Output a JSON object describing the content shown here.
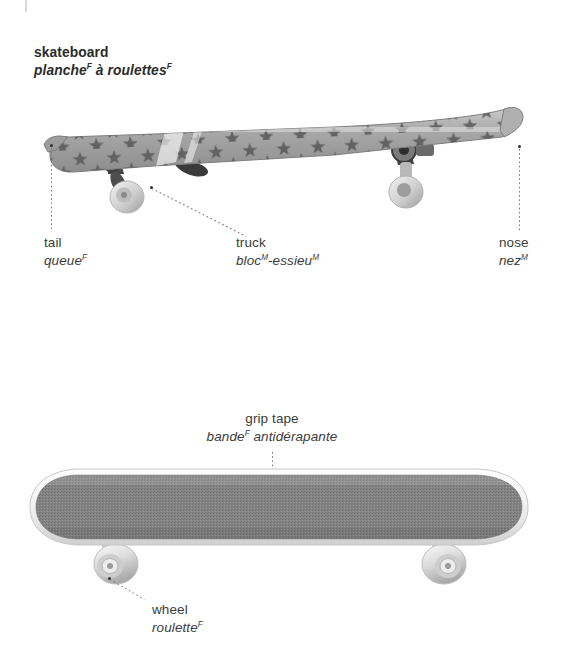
{
  "page": {
    "title_en": "skateboard",
    "title_fr_parts": [
      {
        "text": "planche",
        "sup": "F"
      },
      {
        "text": " à roulettes",
        "sup": "F"
      }
    ],
    "background": "#ffffff",
    "text_color": "#3c3c3c",
    "leader_color": "#7d7d7d"
  },
  "figures": [
    {
      "name": "skateboard-side-view",
      "view": "side",
      "deck_pattern": "stars",
      "deck_color": "#9a9a9a",
      "wheel_color": "#dedede",
      "truck_color": "#6b6b6b"
    },
    {
      "name": "skateboard-top-view",
      "view": "top",
      "deck_color": "#f0f0f0",
      "griptape_color": "#848484",
      "wheel_color": "#d9d9d9"
    }
  ],
  "callouts": [
    {
      "id": "tail",
      "en": "tail",
      "fr": "queue",
      "fr_sup": "F",
      "figure": "skateboard-side-view",
      "align": "left"
    },
    {
      "id": "truck",
      "en": "truck",
      "fr": "bloc",
      "fr_sup": "M",
      "fr2": "-essieu",
      "fr2_sup": "M",
      "figure": "skateboard-side-view",
      "align": "left"
    },
    {
      "id": "nose",
      "en": "nose",
      "fr": "nez",
      "fr_sup": "M",
      "figure": "skateboard-side-view",
      "align": "left"
    },
    {
      "id": "grip-tape",
      "en": "grip tape",
      "fr": "bande",
      "fr_sup": "F",
      "fr2": " antidérapante",
      "fr2_sup": "",
      "figure": "skateboard-top-view",
      "align": "center"
    },
    {
      "id": "wheel",
      "en": "wheel",
      "fr": "roulette",
      "fr_sup": "F",
      "figure": "skateboard-top-view",
      "align": "left"
    }
  ]
}
